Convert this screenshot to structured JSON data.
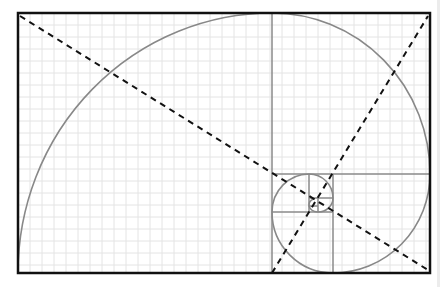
{
  "diagram": {
    "colors": {
      "background": "#ffffff",
      "grid": "#e4e4e4",
      "frame": "#111111",
      "squares": "#8a8a8a",
      "spiral": "#888888",
      "diagonals": "#111111",
      "side_strip": "#ececec"
    },
    "frame": {
      "x": 18,
      "y": 13,
      "width": 412,
      "height": 260
    },
    "grid_step": 12,
    "square_lines": [
      {
        "x1": 272,
        "y1": 13,
        "x2": 272,
        "y2": 273
      },
      {
        "x1": 272,
        "y1": 174,
        "x2": 430,
        "y2": 174
      },
      {
        "x1": 333,
        "y1": 174,
        "x2": 333,
        "y2": 273
      },
      {
        "x1": 272,
        "y1": 212,
        "x2": 333,
        "y2": 212
      },
      {
        "x1": 309,
        "y1": 174,
        "x2": 309,
        "y2": 212
      },
      {
        "x1": 309,
        "y1": 198,
        "x2": 333,
        "y2": 198
      },
      {
        "x1": 318,
        "y1": 198,
        "x2": 318,
        "y2": 212
      },
      {
        "x1": 309,
        "y1": 206,
        "x2": 318,
        "y2": 206
      }
    ],
    "diagonals": [
      {
        "x1": 20,
        "y1": 16,
        "x2": 428,
        "y2": 270
      },
      {
        "x1": 272,
        "y1": 273,
        "x2": 428,
        "y2": 16
      }
    ]
  }
}
